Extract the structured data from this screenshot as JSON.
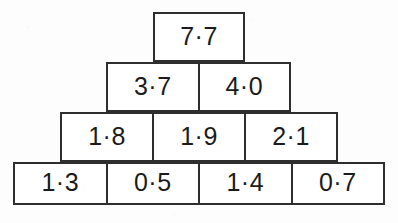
{
  "figure": {
    "type": "addition-pyramid",
    "decimal_separator": "·",
    "line_color": "#2e2e2e",
    "text_color": "#1b1b1b",
    "background_color": "#ffffff",
    "page_background": "#fdfdfd"
  },
  "chart_data": {
    "type": "table",
    "title": "",
    "xlabel": "",
    "ylabel": "",
    "rows": [
      {
        "level": 1,
        "cells": [
          "7·7"
        ]
      },
      {
        "level": 2,
        "cells": [
          "3·7",
          "4·0"
        ]
      },
      {
        "level": 3,
        "cells": [
          "1·8",
          "1·9",
          "2·1"
        ]
      },
      {
        "level": 4,
        "cells": [
          "1·3",
          "0·5",
          "1·4",
          "0·7"
        ]
      }
    ],
    "values": [
      [
        7.7
      ],
      [
        3.7,
        4.0
      ],
      [
        1.8,
        1.9,
        2.1
      ],
      [
        1.3,
        0.5,
        1.4,
        0.7
      ]
    ]
  },
  "pyramid": {
    "row1": {
      "cell1": "7·7"
    },
    "row2": {
      "cell1": "3·7",
      "cell2": "4·0"
    },
    "row3": {
      "cell1": "1·8",
      "cell2": "1·9",
      "cell3": "2·1"
    },
    "row4": {
      "cell1": "1·3",
      "cell2": "0·5",
      "cell3": "1·4",
      "cell4": "0·7"
    }
  }
}
